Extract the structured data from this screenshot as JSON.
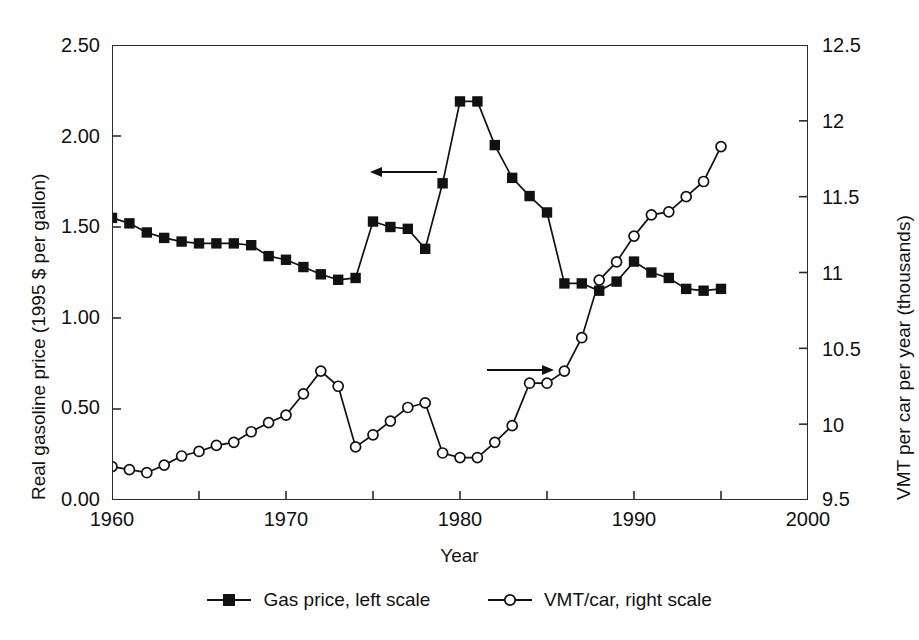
{
  "chart_data": {
    "type": "line",
    "title": "",
    "xlabel": "Year",
    "ylabel": "Real gasoline price (1995 $ per gallon)",
    "y2label": "VMT per car per year (thousands)",
    "xlim": [
      1960,
      2000
    ],
    "ylim": [
      0.0,
      2.5
    ],
    "y2lim": [
      9.5,
      12.5
    ],
    "xticks": [
      1960,
      1970,
      1980,
      1990,
      2000
    ],
    "xtick_labels": [
      "1960",
      "1970",
      "1980",
      "1990",
      "2000"
    ],
    "xminor_step": 5,
    "yticks": [
      0.0,
      0.5,
      1.0,
      1.5,
      2.0,
      2.5
    ],
    "ytick_labels": [
      "0.00",
      "0.50",
      "1.00",
      "1.50",
      "2.00",
      "2.50"
    ],
    "y2ticks": [
      9.5,
      10.0,
      10.5,
      11.0,
      11.5,
      12.0,
      12.5
    ],
    "y2tick_labels": [
      "9.5",
      "10",
      "10.5",
      "11",
      "11.5",
      "12",
      "12.5"
    ],
    "grid": false,
    "legend_position": "bottom",
    "x": [
      1960,
      1961,
      1962,
      1963,
      1964,
      1965,
      1966,
      1967,
      1968,
      1969,
      1970,
      1971,
      1972,
      1973,
      1974,
      1975,
      1976,
      1977,
      1978,
      1979,
      1980,
      1981,
      1982,
      1983,
      1984,
      1985,
      1986,
      1987,
      1988,
      1989,
      1990,
      1991,
      1992,
      1993,
      1994,
      1995
    ],
    "series": [
      {
        "name": "Gas price, left scale",
        "axis": "left",
        "marker": "filled-square",
        "color": "#111111",
        "values": [
          1.55,
          1.52,
          1.47,
          1.44,
          1.42,
          1.41,
          1.41,
          1.41,
          1.4,
          1.34,
          1.32,
          1.28,
          1.24,
          1.21,
          1.22,
          1.53,
          1.5,
          1.49,
          1.38,
          1.74,
          2.19,
          2.19,
          1.95,
          1.77,
          1.67,
          1.58,
          1.19,
          1.19,
          1.15,
          1.2,
          1.31,
          1.25,
          1.22,
          1.16,
          1.15,
          1.16
        ]
      },
      {
        "name": "VMT/car, right scale",
        "axis": "right",
        "marker": "open-circle",
        "color": "#111111",
        "values": [
          9.72,
          9.7,
          9.68,
          9.73,
          9.79,
          9.82,
          9.86,
          9.88,
          9.95,
          10.01,
          10.06,
          10.2,
          10.35,
          10.25,
          9.85,
          9.93,
          10.02,
          10.11,
          10.14,
          9.81,
          9.78,
          9.78,
          9.88,
          9.99,
          10.27,
          10.27,
          10.35,
          10.57,
          10.95,
          11.07,
          11.24,
          11.38,
          11.4,
          11.5,
          11.6,
          11.83
        ]
      }
    ],
    "annotations": [
      {
        "name": "left-arrow",
        "text": "←",
        "points_to": "left-axis"
      },
      {
        "name": "right-arrow",
        "text": "→",
        "points_to": "right-axis"
      }
    ]
  },
  "legend": {
    "items": [
      {
        "label": "Gas price, left scale",
        "marker": "filled-square"
      },
      {
        "label": "VMT/car, right scale",
        "marker": "open-circle"
      }
    ]
  },
  "axes": {
    "x_title": "Year",
    "y_left_title": "Real gasoline price (1995 $ per gallon)",
    "y_right_title": "VMT per car per year (thousands)"
  }
}
